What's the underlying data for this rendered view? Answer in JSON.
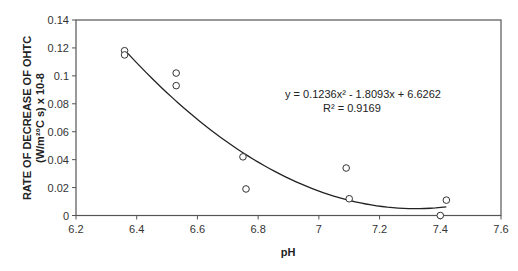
{
  "chart_data": {
    "type": "scatter",
    "title": "",
    "xlabel": "pH",
    "ylabel_lines": [
      "RATE OF DECREASE OF OHTC",
      "(W/m²°C s) x 10-8"
    ],
    "xlim": [
      6.2,
      7.6
    ],
    "ylim": [
      0,
      0.14
    ],
    "x_ticks": [
      "6.2",
      "6.4",
      "6.6",
      "6.8",
      "7",
      "7.2",
      "7.4",
      "7.6"
    ],
    "y_ticks": [
      "0",
      "0.02",
      "0.04",
      "0.06",
      "0.08",
      "0.1",
      "0.12",
      "0.14"
    ],
    "grid": false,
    "legend": null,
    "series": [
      {
        "name": "data",
        "marker": "open-circle",
        "points": [
          {
            "x": 6.36,
            "y": 0.118
          },
          {
            "x": 6.36,
            "y": 0.115
          },
          {
            "x": 6.53,
            "y": 0.102
          },
          {
            "x": 6.53,
            "y": 0.093
          },
          {
            "x": 6.75,
            "y": 0.042
          },
          {
            "x": 6.76,
            "y": 0.019
          },
          {
            "x": 7.09,
            "y": 0.034
          },
          {
            "x": 7.1,
            "y": 0.012
          },
          {
            "x": 7.42,
            "y": 0.011
          },
          {
            "x": 7.4,
            "y": 0.0
          }
        ]
      }
    ],
    "trendline": {
      "type": "polynomial",
      "order": 2,
      "coefficients": {
        "a": 0.1236,
        "b": -1.8093,
        "c": 6.6262
      },
      "x_range": [
        6.36,
        7.42
      ],
      "equation_label": "y = 0.1236x² - 1.8093x + 6.6262",
      "r2_label": "R² = 0.9169"
    }
  }
}
